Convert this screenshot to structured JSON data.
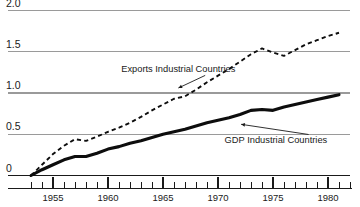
{
  "chart_data": {
    "type": "line",
    "title": "",
    "subtitle": "",
    "xlabel": "",
    "ylabel": "",
    "xlim": [
      1952.0,
      1982.0
    ],
    "ylim": [
      0.0,
      2.05
    ],
    "grid": true,
    "grid_axis": "y",
    "legend_position": "inline-annotation",
    "y_ticks": [
      {
        "value": 2.0,
        "label": "2.0",
        "clipped": true
      },
      {
        "value": 1.5,
        "label": "1.5",
        "clipped": false
      },
      {
        "value": 1.0,
        "label": "1.0",
        "clipped": false
      },
      {
        "value": 0.5,
        "label": "0.5",
        "clipped": false
      },
      {
        "value": 0.0,
        "label": "0",
        "clipped": false
      }
    ],
    "x_ticks_major": [
      {
        "value": 1955,
        "label": "1955"
      },
      {
        "value": 1960,
        "label": "1960"
      },
      {
        "value": 1965,
        "label": "1965"
      },
      {
        "value": 1970,
        "label": "1970"
      },
      {
        "value": 1975,
        "label": "1975"
      },
      {
        "value": 1980,
        "label": "1980"
      }
    ],
    "x_ticks_minor_start": 1953,
    "x_ticks_minor_end": 1982,
    "x_ticks_minor_step": 1,
    "x": [
      1953,
      1954,
      1955,
      1956,
      1957,
      1958,
      1959,
      1960,
      1961,
      1962,
      1963,
      1964,
      1965,
      1966,
      1967,
      1968,
      1969,
      1970,
      1971,
      1972,
      1973,
      1974,
      1975,
      1976,
      1977,
      1978,
      1979,
      1980,
      1981
    ],
    "series": [
      {
        "name": "Exports Industrial Countries",
        "style": "dashed",
        "color": "#0d0d0d",
        "label": "Exports Industrial Countries",
        "label_x": 1961.2,
        "label_y": 1.25,
        "leader_to_x": 1966.4,
        "leader_to_y": 1.06,
        "values": [
          0.0,
          0.13,
          0.26,
          0.36,
          0.44,
          0.42,
          0.47,
          0.53,
          0.58,
          0.64,
          0.71,
          0.79,
          0.86,
          0.93,
          0.96,
          1.04,
          1.13,
          1.21,
          1.29,
          1.38,
          1.47,
          1.54,
          1.49,
          1.45,
          1.52,
          1.59,
          1.64,
          1.69,
          1.73
        ]
      },
      {
        "name": "GDP Industrial Countries",
        "style": "solid",
        "color": "#0d0d0d",
        "label": "GDP Industrial Countries",
        "label_x": 1970.6,
        "label_y": 0.4,
        "leader_to_x": 1972.1,
        "leader_to_y": 0.62,
        "values": [
          0.0,
          0.07,
          0.13,
          0.19,
          0.23,
          0.23,
          0.27,
          0.32,
          0.35,
          0.39,
          0.42,
          0.46,
          0.5,
          0.53,
          0.56,
          0.6,
          0.64,
          0.67,
          0.7,
          0.74,
          0.79,
          0.8,
          0.79,
          0.83,
          0.86,
          0.89,
          0.92,
          0.95,
          0.98
        ]
      }
    ]
  }
}
